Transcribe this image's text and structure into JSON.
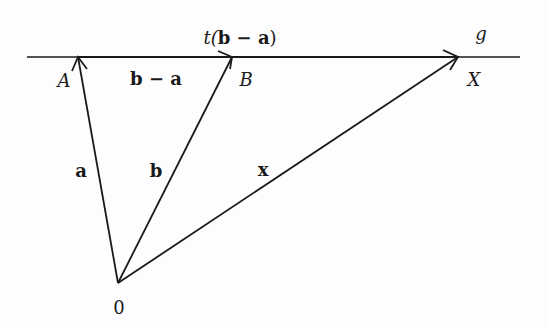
{
  "diagram": {
    "type": "vector-diagram",
    "line": {
      "label": "g"
    },
    "points": {
      "A": {
        "label": "A"
      },
      "B": {
        "label": "B"
      },
      "X": {
        "label": "X"
      },
      "origin": {
        "label": "0"
      }
    },
    "vectors": {
      "a": {
        "label": "a",
        "from": "0",
        "to": "A"
      },
      "b": {
        "label": "b",
        "from": "0",
        "to": "B"
      },
      "x": {
        "label": "x",
        "from": "0",
        "to": "X"
      },
      "b_minus_a": {
        "label": "b − a",
        "from": "A",
        "to": "B"
      },
      "t_b_minus_a": {
        "label_prefix": "t(",
        "label_body": "b − a",
        "label_suffix": ")",
        "from": "B",
        "to": "X"
      }
    },
    "colors": {
      "stroke": "#1a1a1a",
      "background": "#fdfdfd"
    }
  }
}
